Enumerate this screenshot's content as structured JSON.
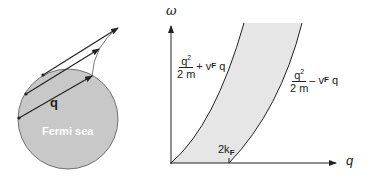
{
  "left_panel": {
    "circle_label": "Fermi sea",
    "vector_label": "q",
    "fill_color": "#c8c8c8"
  },
  "right_panel": {
    "y_axis_label": "ω",
    "x_axis_label": "q",
    "upper_curve": {
      "num": "q",
      "exp": "2",
      "den": "2 m",
      "rest_op": "+",
      "rest_v": "v",
      "rest_sub": "F",
      "rest_q": "q"
    },
    "lower_curve": {
      "num": "q",
      "exp": "2",
      "den": "2 m",
      "rest_op": "–",
      "rest_v": "v",
      "rest_sub": "F",
      "rest_q": "q"
    },
    "tick_label_main": "2k",
    "tick_label_sub": "F",
    "band_fill_color": "#e6e6e6"
  }
}
